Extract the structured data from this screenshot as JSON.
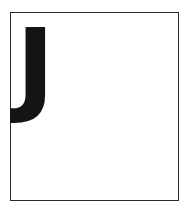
{
  "card": {
    "letter": "J"
  },
  "colors": {
    "background": "#ffffff",
    "card_background": "#ffffff",
    "border": "#2b2b2b",
    "letter": "#141414"
  }
}
